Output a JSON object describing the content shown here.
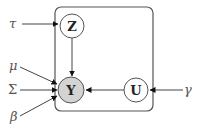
{
  "diagram": {
    "type": "graphical-model",
    "plate": {
      "x": 55,
      "y": 7,
      "width": 98,
      "height": 104,
      "rx": 6,
      "stroke": "#555555"
    },
    "nodes": [
      {
        "id": "Z",
        "label": "Z",
        "cx": 72,
        "cy": 26,
        "r": 12,
        "fill": "#ffffff",
        "observed": false
      },
      {
        "id": "Y",
        "label": "Y",
        "cx": 71,
        "cy": 90,
        "r": 13,
        "fill": "#d3d3d3",
        "observed": true
      },
      {
        "id": "U",
        "label": "U",
        "cx": 136,
        "cy": 90,
        "r": 12,
        "fill": "#ffffff",
        "observed": false
      }
    ],
    "params": [
      {
        "id": "tau",
        "label": "τ",
        "x": 10,
        "y": 28
      },
      {
        "id": "mu",
        "label": "μ",
        "x": 10,
        "y": 68
      },
      {
        "id": "Sigma",
        "label": "Σ",
        "x": 8,
        "y": 94
      },
      {
        "id": "beta",
        "label": "β",
        "x": 10,
        "y": 121
      },
      {
        "id": "gamma",
        "label": "γ",
        "x": 185,
        "y": 94
      }
    ],
    "edges": [
      {
        "from": "tau",
        "to": "Z"
      },
      {
        "from": "Z",
        "to": "Y"
      },
      {
        "from": "U",
        "to": "Y"
      },
      {
        "from": "gamma",
        "to": "U"
      },
      {
        "from": "mu",
        "to": "Y"
      },
      {
        "from": "Sigma",
        "to": "Y"
      },
      {
        "from": "beta",
        "to": "Y"
      }
    ]
  }
}
